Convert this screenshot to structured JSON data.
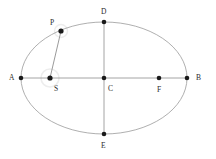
{
  "figure": {
    "type": "geometry-diagram",
    "background_color": "#ffffff",
    "curve_color": "#9a9a9a",
    "axis_color": "#9a9a9a",
    "segment_color": "#8f8f8f",
    "point_color": "#1a1a1a",
    "label_color": "#2b2b2b",
    "highlight_color": "#f2f2f2"
  },
  "ellipse": {
    "center_x": 104,
    "center_y": 78,
    "semi_major_axis": 83,
    "semi_minor_axis": 56,
    "stroke_width": 0.8
  },
  "axes": [
    {
      "name": "major-axis",
      "from": "A",
      "to": "B",
      "x1": 21,
      "y1": 78,
      "x2": 187,
      "y2": 78
    },
    {
      "name": "minor-axis",
      "from": "D",
      "to": "E",
      "x1": 104,
      "y1": 22,
      "x2": 104,
      "y2": 134
    }
  ],
  "segments": [
    {
      "name": "focal-radius-PS",
      "from": "P",
      "to": "S",
      "x1": 61,
      "y1": 31,
      "x2": 50,
      "y2": 78
    }
  ],
  "points": [
    {
      "id": "A",
      "label": "A",
      "x": 21,
      "y": 78,
      "radius": 2.3,
      "label_x": 9,
      "label_y": 74,
      "highlighted": false,
      "role": "left-vertex"
    },
    {
      "id": "S",
      "label": "S",
      "x": 50,
      "y": 78,
      "radius": 2.6,
      "label_x": 54,
      "label_y": 85,
      "highlighted": true,
      "role": "left-focus"
    },
    {
      "id": "C",
      "label": "C",
      "x": 104,
      "y": 78,
      "radius": 2.3,
      "label_x": 108,
      "label_y": 85,
      "highlighted": false,
      "role": "center"
    },
    {
      "id": "F",
      "label": "F",
      "x": 159,
      "y": 78,
      "radius": 2.3,
      "label_x": 157,
      "label_y": 86,
      "highlighted": false,
      "role": "right-focus"
    },
    {
      "id": "B",
      "label": "B",
      "x": 187,
      "y": 78,
      "radius": 2.3,
      "label_x": 196,
      "label_y": 74,
      "highlighted": false,
      "role": "right-vertex"
    },
    {
      "id": "D",
      "label": "D",
      "x": 104,
      "y": 22,
      "radius": 2.3,
      "label_x": 101,
      "label_y": 8,
      "highlighted": false,
      "role": "top-co-vertex"
    },
    {
      "id": "E",
      "label": "E",
      "x": 104,
      "y": 134,
      "radius": 2.3,
      "label_x": 101,
      "label_y": 142,
      "highlighted": false,
      "role": "bottom-co-vertex"
    },
    {
      "id": "P",
      "label": "P",
      "x": 61,
      "y": 31,
      "radius": 2.6,
      "label_x": 50,
      "label_y": 19,
      "highlighted": true,
      "role": "point-on-ellipse"
    }
  ]
}
